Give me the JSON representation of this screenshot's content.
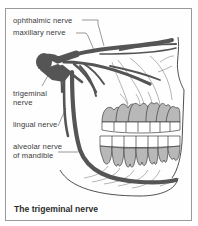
{
  "figure": {
    "caption": "The trigeminal nerve",
    "labels": {
      "ophthalmic": "ophthalmic nerve",
      "maxillary": "maxillary nerve",
      "trigeminal_line1": "trigeminal",
      "trigeminal_line2": "nerve",
      "lingual": "lingual nerve",
      "alveolar_line1": "alveolar nerve",
      "alveolar_line2": "of mandible"
    },
    "colors": {
      "nerve": "#555555",
      "tooth_root": "#b8b8b8",
      "tooth_crown": "#ffffff",
      "outline": "#3c3c3c",
      "border": "#9a9a9a"
    }
  }
}
